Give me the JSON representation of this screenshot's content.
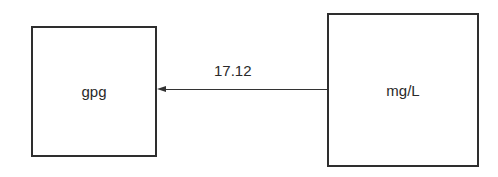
{
  "diagram": {
    "nodes": [
      {
        "id": "gpg",
        "label": "gpg"
      },
      {
        "id": "mgl",
        "label": "mg/L"
      }
    ],
    "edges": [
      {
        "from": "mgl",
        "to": "gpg",
        "label": "17.12"
      }
    ]
  },
  "colors": {
    "stroke": "#2e2e2e",
    "background": "#ffffff",
    "text": "#2a2a2a"
  }
}
